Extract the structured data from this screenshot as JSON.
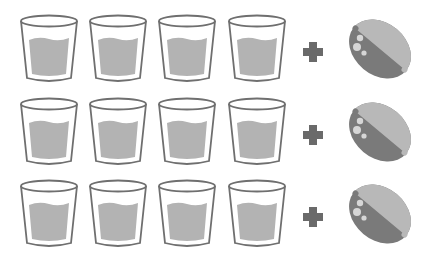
{
  "diagram": {
    "rows": [
      {
        "glasses": 4,
        "operator": "+",
        "item": "lemon"
      },
      {
        "glasses": 4,
        "operator": "+",
        "item": "lemon"
      },
      {
        "glasses": 4,
        "operator": "+",
        "item": "lemon"
      }
    ],
    "icons": {
      "glass": "glass-of-water-icon",
      "operator": "plus-icon",
      "item": "lemon-icon"
    },
    "colors": {
      "background": "#ffffff",
      "glass_outline": "#6f6f6f",
      "water": "#b3b3b3",
      "plus": "#6a6a6a",
      "lemon_light": "#b8b8b8",
      "lemon_dark": "#7a7a7a",
      "lemon_spots": "#d6d6d6"
    }
  }
}
